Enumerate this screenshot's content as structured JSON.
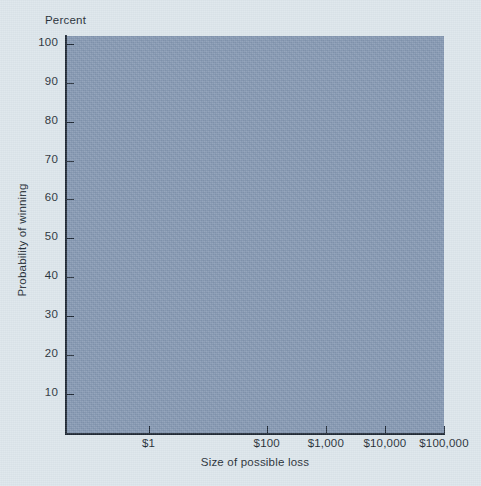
{
  "chart_data": {
    "type": "line",
    "title": "",
    "subtitle": "",
    "xlabel": "Size of possible loss",
    "ylabel": "Probability of winning",
    "y_unit_label": "Percent",
    "x_scale": "log",
    "x_tick_values": [
      1,
      100,
      1000,
      10000,
      100000
    ],
    "x_tick_labels": [
      "$1",
      "$100",
      "$1,000",
      "$10,000",
      "$100,000"
    ],
    "xlim": [
      0.04,
      100000
    ],
    "y_tick_values": [
      10,
      20,
      30,
      40,
      50,
      60,
      70,
      80,
      90,
      100
    ],
    "y_tick_labels": [
      "10",
      "20",
      "30",
      "40",
      "50",
      "60",
      "70",
      "80",
      "90",
      "100"
    ],
    "ylim": [
      0,
      102
    ],
    "grid": false,
    "legend": false,
    "legend_position": "none",
    "series": [],
    "annotations": [],
    "note": "Blank plotting frame: the plot area is a solid filled panel with no plotted data."
  },
  "colors": {
    "page_background": "#dce5eb",
    "plot_fill": "#8295b0",
    "axis_line": "#1d2733",
    "text": "#222b33"
  },
  "axes": {
    "x_title": "Size of possible loss",
    "y_title": "Probability of winning",
    "y_unit": "Percent"
  }
}
